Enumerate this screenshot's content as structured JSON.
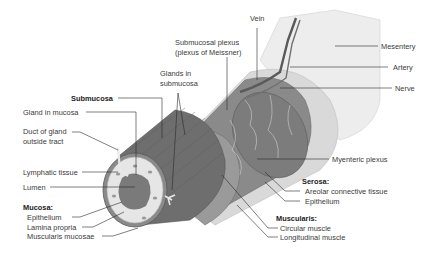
{
  "diagram": {
    "labels": {
      "vein": "Vein",
      "submucosal_plexus_1": "Submucosal plexus",
      "submucosal_plexus_2": "(plexus of Meissner)",
      "mesentery": "Mesentery",
      "artery": "Artery",
      "nerve": "Nerve",
      "glands_submucosa_1": "Glands in",
      "glands_submucosa_2": "submucosa",
      "submucosa": "Submucosa",
      "gland_in_mucosa": "Gland in mucosa",
      "duct_1": "Duct of gland",
      "duct_2": "outside tract",
      "lymphatic_tissue": "Lymphatic tissue",
      "lumen": "Lumen",
      "mucosa_heading": "Mucosa:",
      "epithelium": "Epithelium",
      "lamina_propria": "Lamina propria",
      "muscularis_mucosae": "Muscularis mucosae",
      "myenteric_plexus": "Myenteric plexus",
      "serosa_heading": "Serosa:",
      "areolar_tissue": "Areolar connective tissue",
      "serosa_epithelium": "Epithelium",
      "muscularis_heading": "Muscularis:",
      "circular_muscle": "Circular muscle",
      "longitudinal_muscle": "Longitudinal muscle"
    },
    "colors": {
      "background": "#ffffff",
      "label_text": "#3a3a3a",
      "leader_line": "#2a2a2a",
      "muscle_dark": "#6e6e6e",
      "muscle_mid": "#8a8a8a",
      "mucosa_light": "#e6e6e6",
      "lumen": "#7a7a7a",
      "mesentery": "#ededed",
      "vessel": "#5a5a5a"
    }
  }
}
